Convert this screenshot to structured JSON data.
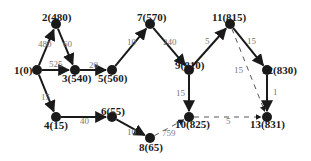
{
  "diagram": {
    "type": "network-graph",
    "colors": {
      "node": "#1a1a1a",
      "edge": "#1a1a1a",
      "dashed_edge": "#555555",
      "edge_label": "#777777"
    },
    "nodes": [
      {
        "id": "1",
        "label": "1(0)",
        "x": 37,
        "y": 70,
        "lx": 14,
        "ly": 74
      },
      {
        "id": "2",
        "label": "2(480)",
        "x": 56,
        "y": 24,
        "lx": 42,
        "ly": 21
      },
      {
        "id": "3",
        "label": "3(540)",
        "x": 75,
        "y": 70,
        "lx": 62,
        "ly": 82
      },
      {
        "id": "4",
        "label": "4(15)",
        "x": 56,
        "y": 117,
        "lx": 44,
        "ly": 129
      },
      {
        "id": "5",
        "label": "5(560)",
        "x": 112,
        "y": 70,
        "lx": 98,
        "ly": 82
      },
      {
        "id": "6",
        "label": "6(55)",
        "x": 112,
        "y": 117,
        "lx": 101,
        "ly": 115
      },
      {
        "id": "7",
        "label": "7(570)",
        "x": 150,
        "y": 24,
        "lx": 137,
        "ly": 21
      },
      {
        "id": "8",
        "label": "8(65)",
        "x": 150,
        "y": 138,
        "lx": 139,
        "ly": 151
      },
      {
        "id": "9",
        "label": "9(810)",
        "x": 189,
        "y": 70,
        "lx": 175,
        "ly": 69
      },
      {
        "id": "10",
        "label": "10(825)",
        "x": 189,
        "y": 117,
        "lx": 175,
        "ly": 128
      },
      {
        "id": "11",
        "label": "11(815)",
        "x": 230,
        "y": 24,
        "lx": 212,
        "ly": 21
      },
      {
        "id": "12",
        "label": "12(830)",
        "x": 267,
        "y": 70,
        "lx": 262,
        "ly": 74
      },
      {
        "id": "13",
        "label": "13(831)",
        "x": 267,
        "y": 117,
        "lx": 250,
        "ly": 128
      }
    ],
    "edges": [
      {
        "from": "1",
        "to": "2",
        "weight": "480",
        "dashed": false,
        "lx": 38,
        "ly": 47
      },
      {
        "from": "2",
        "to": "3",
        "weight": "60",
        "dashed": false,
        "lx": 63,
        "ly": 47
      },
      {
        "from": "1",
        "to": "3",
        "weight": "525",
        "dashed": false,
        "lx": 49,
        "ly": 67
      },
      {
        "from": "3",
        "to": "5",
        "weight": "20",
        "dashed": false,
        "lx": 89,
        "ly": 68
      },
      {
        "from": "5",
        "to": "7",
        "weight": "10",
        "dashed": false,
        "lx": 127,
        "ly": 45
      },
      {
        "from": "7",
        "to": "9",
        "weight": "240",
        "dashed": false,
        "lx": 163,
        "ly": 45
      },
      {
        "from": "9",
        "to": "11",
        "weight": "5",
        "dashed": false,
        "lx": 205,
        "ly": 44
      },
      {
        "from": "11",
        "to": "12",
        "weight": "15",
        "dashed": false,
        "lx": 247,
        "ly": 44
      },
      {
        "from": "11",
        "to": "13",
        "weight": "15",
        "dashed": true,
        "lx": 234,
        "ly": 73
      },
      {
        "from": "12",
        "to": "13",
        "weight": "1",
        "dashed": false,
        "lx": 273,
        "ly": 95
      },
      {
        "from": "9",
        "to": "10",
        "weight": "15",
        "dashed": false,
        "lx": 176,
        "ly": 96
      },
      {
        "from": "10",
        "to": "13",
        "weight": "5",
        "dashed": true,
        "lx": 226,
        "ly": 124
      },
      {
        "from": "1",
        "to": "4",
        "weight": "15",
        "dashed": false,
        "lx": 41,
        "ly": 100
      },
      {
        "from": "4",
        "to": "6",
        "weight": "40",
        "dashed": false,
        "lx": 80,
        "ly": 124
      },
      {
        "from": "6",
        "to": "8",
        "weight": "10",
        "dashed": false,
        "lx": 127,
        "ly": 135
      },
      {
        "from": "8",
        "to": "10",
        "weight": "759",
        "dashed": true,
        "lx": 162,
        "ly": 136
      }
    ]
  }
}
